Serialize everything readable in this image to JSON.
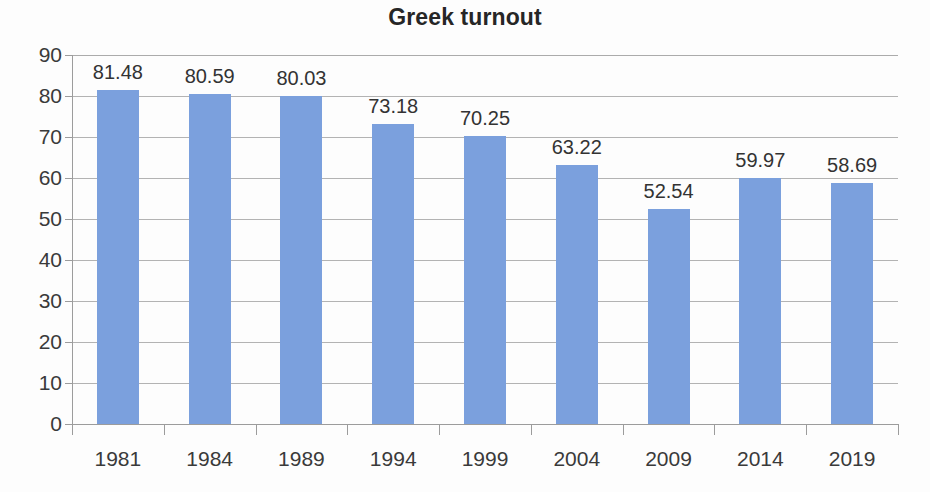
{
  "chart_data": {
    "type": "bar",
    "title": "Greek turnout",
    "xlabel": "",
    "ylabel": "",
    "categories": [
      "1981",
      "1984",
      "1989",
      "1994",
      "1999",
      "2004",
      "2009",
      "2014",
      "2019"
    ],
    "values": [
      81.48,
      80.59,
      80.03,
      73.18,
      70.25,
      63.22,
      52.54,
      59.97,
      58.69
    ],
    "data_labels": [
      "81.48",
      "80.59",
      "80.03",
      "73.18",
      "70.25",
      "63.22",
      "52.54",
      "59.97",
      "58.69"
    ],
    "ylim": [
      0,
      90
    ],
    "ytick_values": [
      0,
      10,
      20,
      30,
      40,
      50,
      60,
      70,
      80,
      90
    ],
    "ytick_labels": [
      "0",
      "10",
      "20",
      "30",
      "40",
      "50",
      "60",
      "70",
      "80",
      "90"
    ],
    "grid": true,
    "legend": false,
    "legend_position": "none",
    "series": [
      {
        "name": "Greek turnout",
        "color": "#7ba0dd",
        "values": [
          81.48,
          80.59,
          80.03,
          73.18,
          70.25,
          63.22,
          52.54,
          59.97,
          58.69
        ]
      }
    ],
    "colors": {
      "bar": "#7ba0dd",
      "gridline": "#a6a6a6",
      "axis": "#9c9c9c",
      "text": "#3a3a3a",
      "title": "#262626",
      "background": "#fdfdfd"
    }
  }
}
